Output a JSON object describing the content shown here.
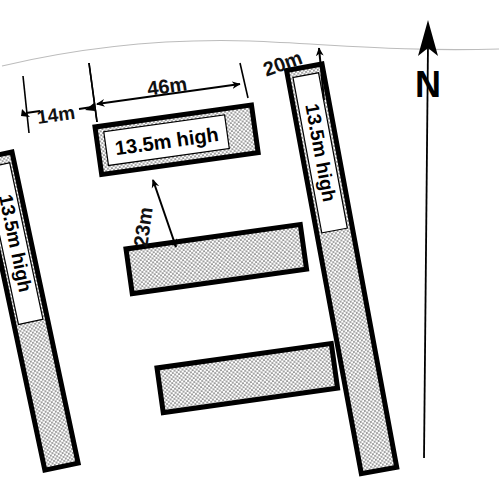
{
  "drawing": {
    "type": "architectural-site-plan",
    "title": "Building block site layout with separation dimensions",
    "background_color": "#ffffff",
    "ink_color": "#000000",
    "hatch_fill_color": "#d8d8d8"
  },
  "north_arrow": {
    "label": "N",
    "icon": "north-arrow-icon",
    "direction": "up",
    "line_top_y": 40,
    "line_bottom_y": 458
  },
  "boundary_line": {
    "name": "site-boundary-curve",
    "color": "#b9b9b9",
    "description": "faint curved site boundary across the top"
  },
  "blocks": [
    {
      "id": "block-left",
      "label": "13.5m high",
      "height_m": 13.5,
      "orientation": "vertical-slanted",
      "rotation_deg": 78,
      "has_label_box": true
    },
    {
      "id": "block-top",
      "label": "13.5m high",
      "height_m": 13.5,
      "orientation": "horizontal-slanted",
      "rotation_deg": -8,
      "has_label_box": true
    },
    {
      "id": "block-middle",
      "label": "",
      "height_m": 13.5,
      "orientation": "horizontal-slanted",
      "rotation_deg": -8,
      "has_label_box": false
    },
    {
      "id": "block-bottom",
      "label": "",
      "height_m": 13.5,
      "orientation": "horizontal-slanted",
      "rotation_deg": -8,
      "has_label_box": false
    },
    {
      "id": "block-right",
      "label": "13.5m high",
      "height_m": 13.5,
      "orientation": "vertical-slanted",
      "rotation_deg": 100,
      "has_label_box": true
    }
  ],
  "dimensions": [
    {
      "id": "dim-14m",
      "label": "14m",
      "value_m": 14,
      "rotation_deg": -8,
      "arrows": "both",
      "description": "gap from left block to top block"
    },
    {
      "id": "dim-46m",
      "label": "46m",
      "value_m": 46,
      "rotation_deg": -8,
      "arrows": "both",
      "description": "length of the top block"
    },
    {
      "id": "dim-20m",
      "label": "20m",
      "value_m": 20,
      "rotation_deg": -20,
      "arrows": "one",
      "description": "gap from top block to right block"
    },
    {
      "id": "dim-23m",
      "label": "23m",
      "value_m": 23,
      "rotation_deg": -82,
      "arrows": "both",
      "description": "gap between top block and middle block"
    }
  ]
}
